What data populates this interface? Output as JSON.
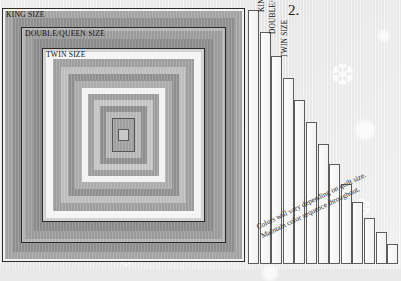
{
  "figure": {
    "number": "2.",
    "note_line1": "Colors will vary depending on quilt size.",
    "note_line2": "Maintain color sequence throughout."
  },
  "size_labels": {
    "king": "KING SIZE",
    "double_queen": "DOUBLE/QUEEN SIZE",
    "twin": "TWIN SIZE"
  },
  "colors": {
    "outline": "#2b2b2b",
    "bar_outline": "#5d5d5d",
    "background": "#e9e9e9",
    "band_dark": "#8c8c8c",
    "band_mid": "#a6a6a6",
    "band_light": "#c9c9c9",
    "band_white": "#f4f4f4"
  },
  "chart_data": {
    "type": "bar",
    "title": "2.",
    "xlabel": "",
    "ylabel": "",
    "grid": false,
    "legend": "none",
    "annotations": [
      "Colors will vary depending on quilt size.",
      "Maintain color sequence throughout."
    ],
    "categories": [
      "KING SIZE",
      "DOUBLE/QUEEN SIZE",
      "TWIN SIZE",
      "round 4",
      "round 5",
      "round 6",
      "round 7",
      "round 8",
      "round 9",
      "round 10",
      "round 11",
      "round 12",
      "round 13"
    ],
    "values": [
      254,
      232,
      208,
      186,
      164,
      142,
      120,
      100,
      80,
      62,
      46,
      32,
      20
    ],
    "ylim": [
      0,
      260
    ]
  },
  "rings": [
    {
      "name": "king-outer-frame",
      "inset": 0,
      "fill": "#f0f0f0",
      "border": "#2b2b2b"
    },
    {
      "name": "king-band-a",
      "inset": 3,
      "fill": "#a2a2a2",
      "border": "none"
    },
    {
      "name": "king-band-b",
      "inset": 10,
      "fill": "#8e8e8e",
      "border": "none"
    },
    {
      "name": "double-queen-frame",
      "inset": 19,
      "fill": "#b4b4b4",
      "border": "#2b2b2b"
    },
    {
      "name": "dq-band-a",
      "inset": 23,
      "fill": "#9a9a9a",
      "border": "none"
    },
    {
      "name": "dq-band-b",
      "inset": 31,
      "fill": "#8a8a8a",
      "border": "none"
    },
    {
      "name": "twin-frame",
      "inset": 40,
      "fill": "#cfcfcf",
      "border": "#2b2b2b"
    },
    {
      "name": "twin-band-a",
      "inset": 44,
      "fill": "#f4f4f4",
      "border": "none"
    },
    {
      "name": "twin-band-b",
      "inset": 51,
      "fill": "#9e9e9e",
      "border": "none"
    },
    {
      "name": "round-4",
      "inset": 59,
      "fill": "#bdbdbd",
      "border": "none"
    },
    {
      "name": "round-5",
      "inset": 66,
      "fill": "#8f8f8f",
      "border": "none"
    },
    {
      "name": "round-6",
      "inset": 73,
      "fill": "#ababab",
      "border": "none"
    },
    {
      "name": "round-7",
      "inset": 80,
      "fill": "#f2f2f2",
      "border": "none"
    },
    {
      "name": "round-8",
      "inset": 86,
      "fill": "#9c9c9c",
      "border": "none"
    },
    {
      "name": "round-9",
      "inset": 92,
      "fill": "#c4c4c4",
      "border": "none"
    },
    {
      "name": "round-10",
      "inset": 98,
      "fill": "#8d8d8d",
      "border": "none"
    },
    {
      "name": "round-11",
      "inset": 104,
      "fill": "#b6b6b6",
      "border": "none"
    },
    {
      "name": "center-block",
      "inset": 110,
      "fill": "#9f9f9f",
      "border": "#555"
    }
  ],
  "bars": [
    {
      "name": "bar-king-size",
      "label": "KING SIZE",
      "height": 254,
      "width": 11
    },
    {
      "name": "bar-double-queen-size",
      "label": "DOUBLE/QUEEN SIZE",
      "height": 232,
      "width": 11
    },
    {
      "name": "bar-twin-size",
      "label": "TWIN SIZE",
      "height": 208,
      "width": 11
    },
    {
      "name": "bar-round-4",
      "label": "",
      "height": 186,
      "width": 11
    },
    {
      "name": "bar-round-5",
      "label": "",
      "height": 164,
      "width": 11
    },
    {
      "name": "bar-round-6",
      "label": "",
      "height": 142,
      "width": 11
    },
    {
      "name": "bar-round-7",
      "label": "",
      "height": 120,
      "width": 11
    },
    {
      "name": "bar-round-8",
      "label": "",
      "height": 100,
      "width": 11
    },
    {
      "name": "bar-round-9",
      "label": "",
      "height": 80,
      "width": 11
    },
    {
      "name": "bar-round-10",
      "label": "",
      "height": 62,
      "width": 11
    },
    {
      "name": "bar-round-11",
      "label": "",
      "height": 46,
      "width": 11
    },
    {
      "name": "bar-round-12",
      "label": "",
      "height": 32,
      "width": 11
    },
    {
      "name": "bar-round-13",
      "label": "",
      "height": 20,
      "width": 11
    }
  ]
}
